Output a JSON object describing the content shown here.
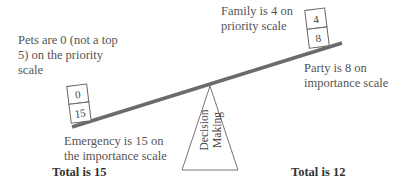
{
  "diagram": {
    "left": {
      "annotation_top": "Pets are 0 (not a top 5) on the priority scale",
      "annotation_bottom": "Emergency is 15 on the importance scale",
      "total": "Total is 15",
      "boxes": [
        "0",
        "15"
      ]
    },
    "right": {
      "annotation_top": "Family is 4 on priority scale",
      "annotation_bottom": "Party is 8 on importance scale",
      "total": "Total is 12",
      "boxes": [
        "4",
        "8"
      ]
    },
    "fulcrum": {
      "line1": "Decision",
      "line2": "Making"
    },
    "colors": {
      "beam": "#6b6b6b",
      "outline": "#777777",
      "text": "#555555"
    }
  }
}
